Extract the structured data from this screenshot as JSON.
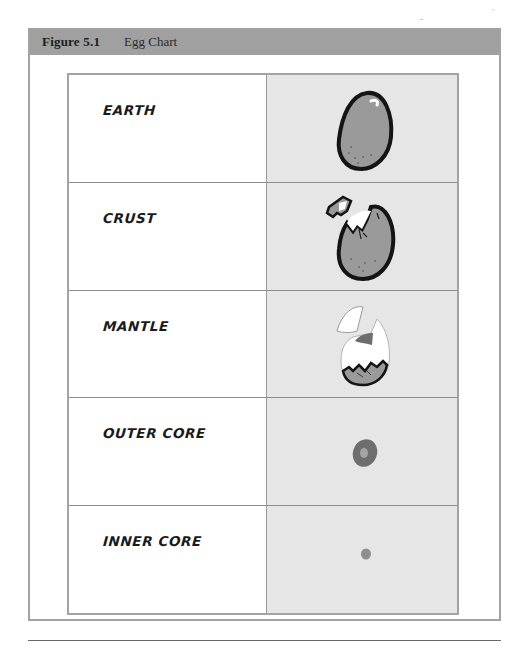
{
  "figure": {
    "number": "Figure 5.1",
    "title": "Egg Chart",
    "header_color": "#a0a0a0",
    "frame_color": "#a3a3a3"
  },
  "table": {
    "columns": [
      "Layer",
      "Egg Illustration"
    ],
    "rows": [
      {
        "label": "EARTH",
        "icon": "whole-egg-icon",
        "description": "Whole egg with shell"
      },
      {
        "label": "CRUST",
        "icon": "cracked-shell-egg-icon",
        "description": "Egg with shell piece breaking off"
      },
      {
        "label": "MANTLE",
        "icon": "egg-white-icon",
        "description": "Egg white with shell removed, yolk visible"
      },
      {
        "label": "OUTER CORE",
        "icon": "yolk-icon",
        "description": "Dark yolk ring with lighter center"
      },
      {
        "label": "INNER CORE",
        "icon": "yolk-center-icon",
        "description": "Small center dot"
      }
    ],
    "image_cell_color": "#e6e6e6",
    "egg_shell_color": "#9a9a9a",
    "yolk_color": "#6e6e6e"
  }
}
